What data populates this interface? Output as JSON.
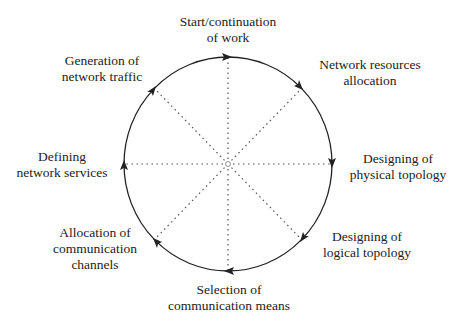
{
  "diagram": {
    "type": "cycle",
    "direction": "clockwise",
    "colors": {
      "circle": "#222222",
      "spokes": "#555555",
      "text": "#222222",
      "background": "#ffffff"
    },
    "center_marker": "o",
    "stages": [
      {
        "id": "top",
        "lines": [
          "Start/continuation",
          "of work"
        ]
      },
      {
        "id": "top-right",
        "lines": [
          "Network resources",
          "allocation"
        ]
      },
      {
        "id": "right",
        "lines": [
          "Designing of",
          "physical topology"
        ]
      },
      {
        "id": "bottom-right",
        "lines": [
          "Designing of",
          "logical topology"
        ]
      },
      {
        "id": "bottom",
        "lines": [
          "Selection of",
          "communication means"
        ]
      },
      {
        "id": "bottom-left",
        "lines": [
          "Allocation of",
          "communication",
          "channels"
        ]
      },
      {
        "id": "left",
        "lines": [
          "Defining",
          "network services"
        ]
      },
      {
        "id": "top-left",
        "lines": [
          "Generation of",
          "network traffic"
        ]
      }
    ]
  }
}
